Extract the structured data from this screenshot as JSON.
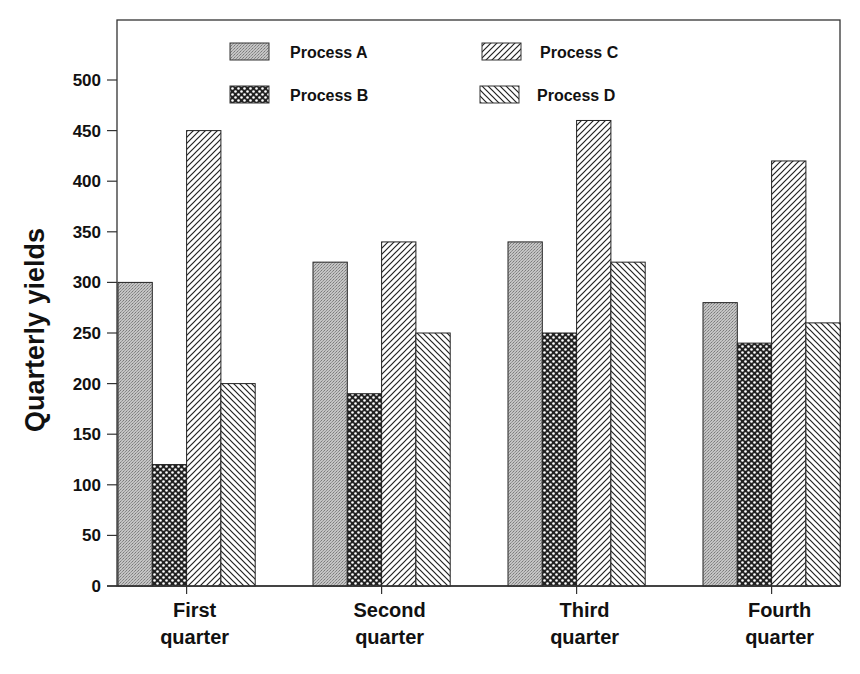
{
  "chart_data": {
    "type": "bar",
    "title": "",
    "xlabel": "",
    "ylabel": "Quarterly yields",
    "ylim": [
      0,
      550
    ],
    "yticks": [
      0,
      50,
      100,
      150,
      200,
      250,
      300,
      350,
      400,
      450,
      500
    ],
    "grid": false,
    "legend_position": "top-inside",
    "categories": [
      [
        "First",
        "quarter"
      ],
      [
        "Second",
        "quarter"
      ],
      [
        "Third",
        "quarter"
      ],
      [
        "Fourth",
        "quarter"
      ]
    ],
    "series": [
      {
        "name": "Process A",
        "pattern": "gray-stipple",
        "values": [
          300,
          320,
          340,
          280
        ]
      },
      {
        "name": "Process B",
        "pattern": "crosshatch",
        "values": [
          120,
          190,
          250,
          240
        ]
      },
      {
        "name": "Process C",
        "pattern": "diagonal-forward",
        "values": [
          450,
          340,
          460,
          420
        ]
      },
      {
        "name": "Process D",
        "pattern": "diagonal-backward",
        "values": [
          200,
          250,
          320,
          260
        ]
      }
    ],
    "colors": {
      "stroke": "#222222",
      "stipple": "#b8b8b8",
      "background": "#ffffff"
    }
  }
}
